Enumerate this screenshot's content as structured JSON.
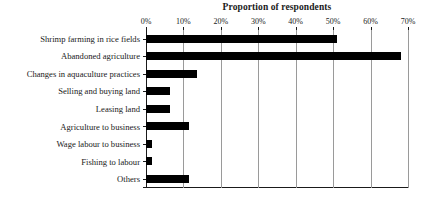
{
  "chart_data": {
    "type": "bar",
    "orientation": "horizontal",
    "title": "Proportion of respondents",
    "xlabel": "",
    "ylabel": "",
    "xlim": [
      0,
      70
    ],
    "xtick_labels": [
      "0%",
      "10%",
      "20%",
      "30%",
      "40%",
      "50%",
      "60%",
      "70%"
    ],
    "xtick_values": [
      0,
      10,
      20,
      30,
      40,
      50,
      60,
      70
    ],
    "grid": true,
    "legend": "none",
    "bar_color": "#000000",
    "gridline_color": "#9a9a9a",
    "axis_color": "#1a1a1a",
    "categories": [
      "Shrimp farming in rice fields",
      "Abandoned agriculture",
      "Changes in aquaculture practices",
      "Selling and buying land",
      "Leasing land",
      "Agriculture to business",
      "Wage labour to business",
      "Fishing to labour",
      "Others"
    ],
    "values": [
      51,
      68,
      13.5,
      6.5,
      6.5,
      11.5,
      1.5,
      1.5,
      11.5
    ]
  }
}
